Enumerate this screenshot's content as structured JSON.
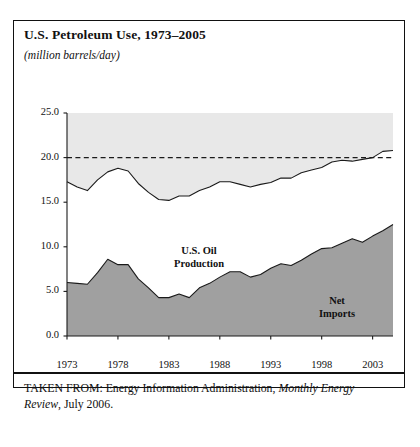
{
  "title": "U.S. Petroleum Use, 1973–2005",
  "subtitle": "(million barrels/day)",
  "caption": {
    "prefix": "TAKEN FROM: Energy Information Administration, ",
    "source_italic": "Monthly Energy Review",
    "suffix": ", July 2006."
  },
  "colors": {
    "imports_fill": "#a0a0a0",
    "gap_fill": "#e8e8e8",
    "line": "#1a1a1a",
    "frame": "#111111"
  },
  "chart_data": {
    "type": "area",
    "title": "U.S. Petroleum Use, 1973–2005",
    "xlabel": "",
    "ylabel": "million barrels/day",
    "xlim": [
      1973,
      2005
    ],
    "ylim": [
      0.0,
      25.0
    ],
    "yticks": [
      "0.0",
      "5.0",
      "10.0",
      "15.0",
      "20.0",
      "25.0"
    ],
    "ytick_values": [
      0.0,
      5.0,
      10.0,
      15.0,
      20.0,
      25.0
    ],
    "xticks": [
      "1973",
      "1978",
      "1983",
      "1988",
      "1993",
      "1998",
      "2003"
    ],
    "xtick_values": [
      1973,
      1978,
      1983,
      1988,
      1993,
      1998,
      2003
    ],
    "grid": false,
    "legend": "inline-labels",
    "reference_line": {
      "value": 20.0,
      "style": "dashed",
      "label": ""
    },
    "annotations": [
      {
        "text": "U.S. Oil Production",
        "lines": [
          "U.S. Oil",
          "Production"
        ],
        "x": 1986,
        "y": 13.5
      },
      {
        "text": "Net Imports",
        "lines": [
          "Net",
          "Imports"
        ],
        "x": 2000,
        "y": 7.0
      }
    ],
    "x": [
      1973,
      1974,
      1975,
      1976,
      1977,
      1978,
      1979,
      1980,
      1981,
      1982,
      1983,
      1984,
      1985,
      1986,
      1987,
      1988,
      1989,
      1990,
      1991,
      1992,
      1993,
      1994,
      1995,
      1996,
      1997,
      1998,
      1999,
      2000,
      2001,
      2002,
      2003,
      2004,
      2005
    ],
    "series": [
      {
        "name": "Net Imports",
        "fill": "#a0a0a0",
        "values": [
          6.0,
          5.9,
          5.8,
          7.1,
          8.6,
          8.0,
          8.0,
          6.4,
          5.4,
          4.3,
          4.3,
          4.7,
          4.3,
          5.4,
          5.9,
          6.6,
          7.2,
          7.2,
          6.6,
          6.9,
          7.6,
          8.1,
          7.9,
          8.5,
          9.2,
          9.8,
          9.9,
          10.4,
          10.9,
          10.5,
          11.2,
          11.8,
          12.5
        ]
      },
      {
        "name": "U.S. Petroleum Consumption (total)",
        "fill": "#e8e8e8",
        "values": [
          17.3,
          16.7,
          16.3,
          17.5,
          18.4,
          18.8,
          18.5,
          17.1,
          16.1,
          15.3,
          15.2,
          15.7,
          15.7,
          16.3,
          16.7,
          17.3,
          17.3,
          17.0,
          16.7,
          17.0,
          17.2,
          17.7,
          17.7,
          18.3,
          18.6,
          18.9,
          19.5,
          19.7,
          19.6,
          19.8,
          20.0,
          20.7,
          20.8
        ]
      }
    ],
    "band_notes": "Light gray band spans from the consumption line up to the 25.0 top of the plot; dark gray area is net imports; the white gap between them is U.S. oil production."
  }
}
